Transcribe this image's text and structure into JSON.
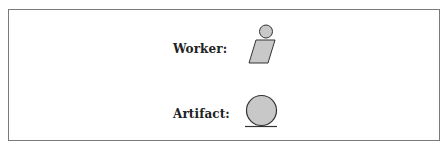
{
  "legend": {
    "items": [
      {
        "label": "Worker:",
        "icon": "worker-icon"
      },
      {
        "label": "Artifact:",
        "icon": "artifact-icon"
      }
    ]
  },
  "colors": {
    "fill": "#c8c8c8",
    "stroke": "#333333",
    "border": "#7a7a7a"
  }
}
